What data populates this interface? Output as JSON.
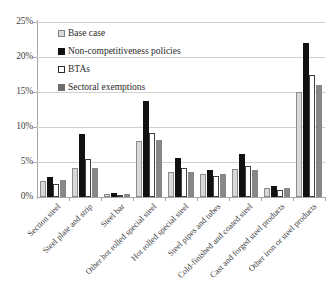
{
  "chart_data": {
    "type": "bar",
    "title": "",
    "xlabel": "",
    "ylabel": "",
    "ylim": [
      0,
      25
    ],
    "ytick_labels": [
      "25%",
      "20%",
      "15%",
      "10%",
      "5%",
      "0%"
    ],
    "ytick_values": [
      25,
      20,
      15,
      10,
      5,
      0
    ],
    "grid": true,
    "legend_position": "upper-left",
    "categories": [
      "Section steel",
      "Steel plate and strip",
      "Steel bar",
      "Other hot rolled special steel",
      "Hot rolled special steel",
      "Steel pipes and tubes",
      "Cold-finished and coated steel",
      "Cast and forged steel products",
      "Other iron or steel products"
    ],
    "series": [
      {
        "name": "Base case",
        "color": "#d9d9d9",
        "values": [
          2.3,
          4.2,
          0.4,
          8.0,
          3.6,
          3.3,
          4.0,
          1.3,
          15.0
        ]
      },
      {
        "name": "Non-competitiveness policies",
        "color": "#111111",
        "values": [
          2.8,
          9.0,
          0.6,
          13.7,
          5.6,
          3.8,
          6.2,
          1.6,
          22.0
        ]
      },
      {
        "name": "BTAs",
        "color": "#ffffff",
        "values": [
          1.8,
          5.5,
          0.3,
          9.2,
          4.2,
          3.0,
          4.5,
          1.0,
          17.5
        ]
      },
      {
        "name": "Sectoral exemptions",
        "color": "#878787",
        "values": [
          2.4,
          4.2,
          0.4,
          8.2,
          3.6,
          3.3,
          3.9,
          1.3,
          16.0
        ]
      }
    ]
  }
}
